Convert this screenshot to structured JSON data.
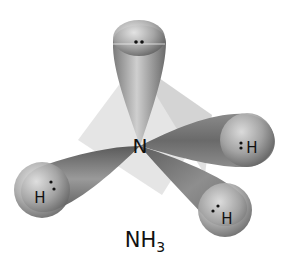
{
  "diagram": {
    "molecule": "NH3",
    "caption": {
      "base": "NH",
      "subscript": "3"
    },
    "central_atom": {
      "label": "N",
      "x": 140,
      "y": 146
    },
    "lone_pair": {
      "dots": "··",
      "position": "top lobe"
    },
    "hydrogens": [
      {
        "label": "H",
        "position": "left",
        "x": 40,
        "y": 197
      },
      {
        "label": "H",
        "position": "right",
        "x": 252,
        "y": 147
      },
      {
        "label": "H",
        "position": "lower-right",
        "x": 227,
        "y": 218
      }
    ],
    "colors": {
      "lobe_dark": "#6e6e6e",
      "lobe_light": "#d8d8d8",
      "tetrahedron": "#c8c8c8",
      "text": "#111111"
    }
  }
}
